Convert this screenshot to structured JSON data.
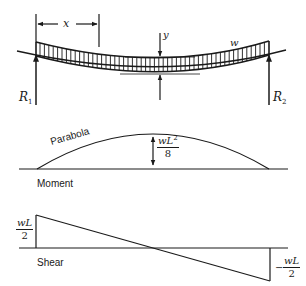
{
  "beam": {
    "span_label": "x",
    "deflection_label": "y",
    "load_label": "w",
    "left_reaction": {
      "symbol": "R",
      "sub": "1"
    },
    "right_reaction": {
      "symbol": "R",
      "sub": "2"
    }
  },
  "moment": {
    "curve_label": "Parabola",
    "max_num": "wL",
    "max_exp": "2",
    "max_den": "8",
    "title": "Moment"
  },
  "shear": {
    "left_num": "wL",
    "left_den": "2",
    "right_sign": "−",
    "right_num": "wL",
    "right_den": "2",
    "title": "Shear"
  },
  "colors": {
    "ink": "#1a1a1a",
    "background": "#ffffff"
  }
}
